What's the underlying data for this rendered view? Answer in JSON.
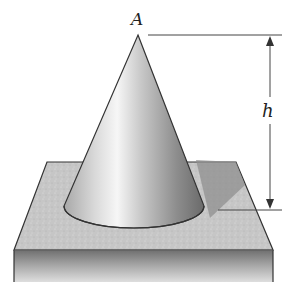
{
  "figure": {
    "labels": {
      "apex": "A",
      "height": "h"
    },
    "colors": {
      "outline": "#333333",
      "dimension_line": "#444444",
      "plate_top": "#c4c4c4",
      "plate_front_top": "#7a7a7a",
      "plate_front_bottom": "#d8d8d8",
      "cone_highlight": "#f4f4f4",
      "cone_shadow": "#6e6e6e"
    }
  }
}
